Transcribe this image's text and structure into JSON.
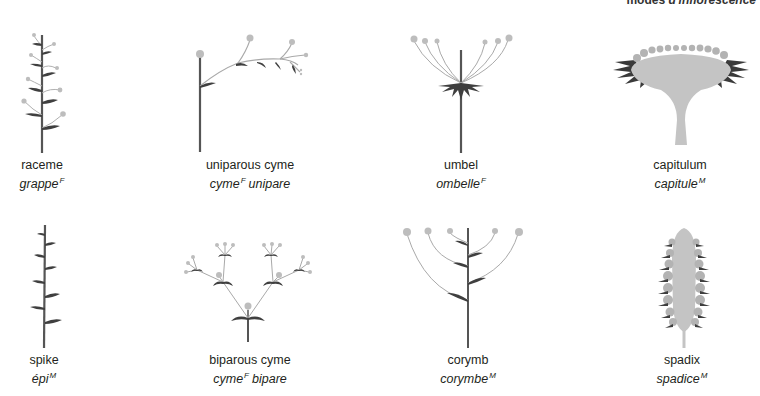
{
  "header": {
    "text_en": "modes",
    "text_fr": "d'inflorescence"
  },
  "colors": {
    "stem": "#555555",
    "leaf_dark": "#3a3a3a",
    "flower": "#b8b8b8",
    "pedicel": "#a9a9a9",
    "receptacle": "#c4c4c4"
  },
  "inflorescences": [
    {
      "id": "raceme",
      "en": "raceme",
      "fr": "grappe",
      "gender": "F",
      "fr_tail": ""
    },
    {
      "id": "uniparous-cyme",
      "en": "uniparous cyme",
      "fr": "cyme",
      "gender": "F",
      "fr_tail": "unipare"
    },
    {
      "id": "umbel",
      "en": "umbel",
      "fr": "ombelle",
      "gender": "F",
      "fr_tail": ""
    },
    {
      "id": "capitulum",
      "en": "capitulum",
      "fr": "capitule",
      "gender": "M",
      "fr_tail": ""
    },
    {
      "id": "spike",
      "en": "spike",
      "fr": "épi",
      "gender": "M",
      "fr_tail": ""
    },
    {
      "id": "biparous-cyme",
      "en": "biparous cyme",
      "fr": "cyme",
      "gender": "F",
      "fr_tail": "bipare"
    },
    {
      "id": "corymb",
      "en": "corymb",
      "fr": "corymbe",
      "gender": "M",
      "fr_tail": ""
    },
    {
      "id": "spadix",
      "en": "spadix",
      "fr": "spadice",
      "gender": "M",
      "fr_tail": ""
    }
  ]
}
